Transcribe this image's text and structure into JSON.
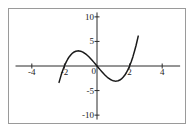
{
  "figure": {
    "background_color": "#ffffff",
    "frame_color": "#9a9a9a",
    "curve_color": "#1a1a1a",
    "axis_color": "#2b2b2b",
    "text_color": "#1c1c1c"
  },
  "chart_data": {
    "type": "line",
    "title": "",
    "subtitle": "",
    "xlabel": "",
    "ylabel": "",
    "grid": false,
    "legend": null,
    "xlim": [
      -5.4,
      5.4
    ],
    "ylim": [
      -11.6,
      11.6
    ],
    "xticks": [
      -4,
      -2,
      0,
      2,
      4
    ],
    "xtick_labels": [
      "-4",
      "-2",
      "0",
      "2",
      "4"
    ],
    "yticks": [
      -10,
      -5,
      5,
      10
    ],
    "ytick_labels": [
      "-10",
      "-5",
      "5",
      "10"
    ],
    "origin_label": "0",
    "function_expression": "x^3 - 4x",
    "annotations": [],
    "series": [
      {
        "name": "cubic",
        "color": "#1a1a1a",
        "roots": [
          -2,
          0,
          2
        ],
        "local_max": {
          "x": -1.15,
          "y": 3.08
        },
        "local_min": {
          "x": 1.15,
          "y": -3.08
        },
        "x_domain": [
          -2.33,
          2.53
        ],
        "x": [
          -2.33,
          -2.2,
          -2.1,
          -2.0,
          -1.9,
          -1.8,
          -1.7,
          -1.6,
          -1.5,
          -1.4,
          -1.3,
          -1.2,
          -1.15,
          -1.1,
          -1.0,
          -0.9,
          -0.8,
          -0.7,
          -0.6,
          -0.5,
          -0.4,
          -0.3,
          -0.2,
          -0.1,
          0.0,
          0.1,
          0.2,
          0.3,
          0.4,
          0.5,
          0.6,
          0.7,
          0.8,
          0.9,
          1.0,
          1.1,
          1.15,
          1.2,
          1.3,
          1.4,
          1.5,
          1.6,
          1.7,
          1.8,
          1.9,
          2.0,
          2.1,
          2.2,
          2.3,
          2.4,
          2.53
        ],
        "y": [
          -3.33,
          -1.85,
          -0.86,
          0.0,
          0.74,
          1.37,
          1.89,
          2.3,
          2.63,
          2.86,
          3.0,
          3.07,
          3.08,
          3.07,
          3.0,
          2.87,
          2.69,
          2.46,
          2.18,
          1.88,
          1.54,
          1.17,
          0.79,
          0.4,
          0.0,
          -0.4,
          -0.79,
          -1.17,
          -1.54,
          -1.88,
          -2.18,
          -2.46,
          -2.69,
          -2.87,
          -3.0,
          -3.07,
          -3.08,
          -3.07,
          -3.0,
          -2.86,
          -2.63,
          -2.3,
          -1.89,
          -1.37,
          -0.74,
          0.0,
          0.86,
          1.85,
          3.0,
          4.22,
          6.08
        ]
      }
    ]
  }
}
